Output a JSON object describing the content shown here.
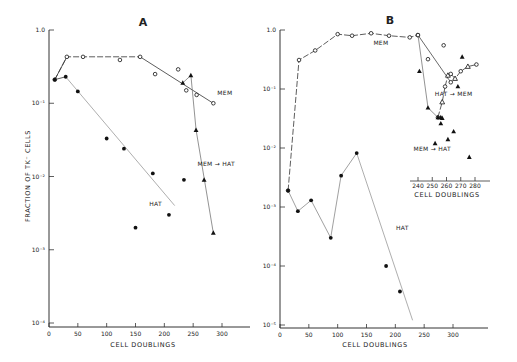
{
  "figure": {
    "panel_a_title": "A",
    "panel_b_title": "B",
    "y_axis_label": "FRACTION OF TK⁻ CELLS",
    "x_axis_label": "CELL DOUBLINGS",
    "inset_x_axis_label": "CELL DOUBLINGS"
  },
  "chart_data": [
    {
      "panel": "A",
      "type": "scatter",
      "title": "A",
      "xlabel": "CELL DOUBLINGS",
      "ylabel": "FRACTION OF TK⁻ CELLS",
      "yscale": "log",
      "xlim": [
        0,
        350
      ],
      "ylim": [
        0.0001,
        1.0
      ],
      "xticks": [
        0,
        50,
        100,
        150,
        200,
        250,
        300
      ],
      "yticks": [
        1.0,
        0.1,
        0.01,
        0.001,
        0.0001
      ],
      "ytick_labels": [
        "1.0",
        "10⁻¹",
        "10⁻²",
        "10⁻³",
        "10⁻⁴"
      ],
      "series": [
        {
          "name": "MEM",
          "marker": "open-circle",
          "line": "dashed-then-solid",
          "x": [
            10,
            31,
            59,
            123,
            158,
            184,
            224,
            238,
            256,
            285
          ],
          "y": [
            0.21,
            0.43,
            0.43,
            0.39,
            0.43,
            0.25,
            0.29,
            0.15,
            0.13,
            0.1
          ]
        },
        {
          "name": "HAT",
          "marker": "filled-circle",
          "line": "solid-fit",
          "x": [
            10,
            29,
            50,
            100,
            130,
            180,
            150,
            208,
            234
          ],
          "y": [
            0.21,
            0.23,
            0.145,
            0.033,
            0.024,
            0.011,
            0.002,
            0.003,
            0.009
          ]
        },
        {
          "name": "MEM → HAT",
          "marker": "filled-triangle",
          "line": "solid",
          "x": [
            232,
            246,
            255,
            269,
            285
          ],
          "y": [
            0.19,
            0.24,
            0.043,
            0.009,
            0.0017
          ]
        }
      ],
      "annotations": [
        {
          "text": "MEM",
          "x": 305,
          "y": 0.13
        },
        {
          "text": "HAT",
          "x": 185,
          "y": 0.004
        },
        {
          "text": "MEM → HAT",
          "x": 290,
          "y": 0.014
        }
      ]
    },
    {
      "panel": "B",
      "type": "scatter",
      "title": "B",
      "xlabel": "CELL DOUBLINGS",
      "ylabel": "",
      "yscale": "log",
      "xlim": [
        0,
        350
      ],
      "ylim": [
        1e-05,
        1.0
      ],
      "xticks": [
        0,
        50,
        100,
        150,
        200,
        250,
        300
      ],
      "yticks": [
        1.0,
        0.1,
        0.01,
        0.001,
        0.0001,
        1e-05
      ],
      "ytick_labels": [
        "1.0",
        "10⁻¹",
        "10⁻²",
        "10⁻³",
        "10⁻⁴",
        "10⁻⁵"
      ],
      "series": [
        {
          "name": "MEM",
          "marker": "open-circle",
          "line": "dashed",
          "x": [
            14,
            33,
            61,
            100,
            125,
            158,
            189,
            225,
            239
          ],
          "y": [
            0.0019,
            0.31,
            0.45,
            0.85,
            0.8,
            0.88,
            0.8,
            0.75,
            0.82
          ]
        },
        {
          "name": "HAT",
          "marker": "filled-circle",
          "line": "solid",
          "x": [
            14,
            31,
            54,
            88,
            106,
            133,
            184,
            208
          ],
          "y": [
            0.0019,
            0.00085,
            0.0013,
            0.0003,
            0.0034,
            0.0082,
            0.0001,
            3.7e-05
          ]
        }
      ],
      "annotations": [
        {
          "text": "MEM",
          "x": 175,
          "y": 0.55
        },
        {
          "text": "HAT",
          "x": 212,
          "y": 0.0004
        }
      ]
    },
    {
      "panel": "B-inset",
      "type": "scatter",
      "xlabel": "CELL DOUBLINGS",
      "xlim": [
        235,
        290
      ],
      "xticks": [
        240,
        250,
        260,
        270,
        280
      ],
      "yscale": "log",
      "series": [
        {
          "name": "MEM",
          "marker": "open-circle",
          "line": "solid",
          "x": [
            240,
            247,
            258,
            263
          ],
          "y": [
            0.82,
            0.32,
            0.55,
            0.13
          ]
        },
        {
          "name": "HAT → MEM",
          "marker": "open-circle + open-triangle",
          "line": "dashed",
          "x": [
            254,
            257,
            259,
            261,
            263,
            266,
            270,
            275,
            281
          ],
          "y": [
            0.033,
            0.06,
            0.11,
            0.17,
            0.18,
            0.15,
            0.2,
            0.24,
            0.26
          ]
        },
        {
          "name": "MEM → HAT",
          "marker": "filled-triangle",
          "line": "solid",
          "x": [
            241,
            247,
            254,
            256,
            257,
            256,
            252,
            261,
            265,
            268,
            271,
            276
          ],
          "y": [
            0.2,
            0.048,
            0.033,
            0.033,
            0.032,
            0.026,
            0.012,
            0.014,
            0.019,
            0.11,
            0.35,
            0.007
          ]
        }
      ],
      "annotations": [
        {
          "text": "HAT → MEM",
          "x": 265,
          "y": 0.075
        },
        {
          "text": "MEM → HAT",
          "x": 250,
          "y": 0.009
        }
      ]
    }
  ]
}
